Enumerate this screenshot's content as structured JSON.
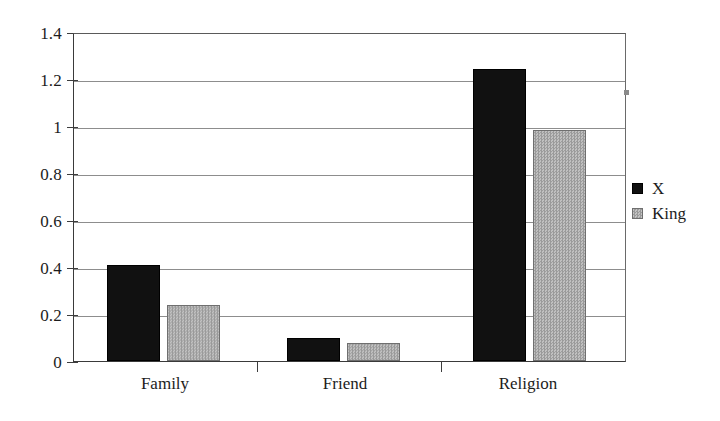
{
  "chart_data": {
    "type": "bar",
    "title": "",
    "subtitle": "",
    "xlabel": "",
    "ylabel": "",
    "categories": [
      "Family",
      "Friend",
      "Religion"
    ],
    "series": [
      {
        "name": "X",
        "color": "#111111",
        "values": [
          0.41,
          0.1,
          1.25
        ]
      },
      {
        "name": "King",
        "color": "#a8a8a8",
        "values": [
          0.24,
          0.075,
          0.99
        ]
      }
    ],
    "ylim": [
      0,
      1.4
    ],
    "y_ticks": [
      "0",
      "0.2",
      "0.4",
      "0.6",
      "0.8",
      "1",
      "1.2",
      "1.4"
    ],
    "y_tick_values": [
      0,
      0.2,
      0.4,
      0.6,
      0.8,
      1,
      1.2,
      1.4
    ],
    "grid": true,
    "grid_axis": "y",
    "legend": true,
    "legend_position": "right"
  },
  "axes": {
    "y_labels": {
      "t0": "0",
      "t1": "0.2",
      "t2": "0.4",
      "t3": "0.6",
      "t4": "0.8",
      "t5": "1",
      "t6": "1.2",
      "t7": "1.4"
    },
    "x_labels": {
      "c0": "Family",
      "c1": "Friend",
      "c2": "Religion"
    }
  },
  "legend": {
    "entries": {
      "e0": "X",
      "e1": "King"
    }
  }
}
